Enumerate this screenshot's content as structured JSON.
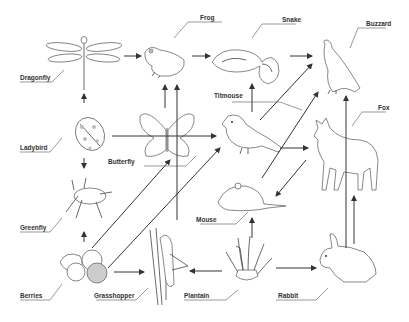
{
  "diagram": {
    "type": "food-web",
    "organisms": [
      {
        "id": "dragonfly",
        "label": "Dragonfly"
      },
      {
        "id": "frog",
        "label": "Frog"
      },
      {
        "id": "snake",
        "label": "Snake"
      },
      {
        "id": "buzzard",
        "label": "Buzzard"
      },
      {
        "id": "ladybird",
        "label": "Ladybird"
      },
      {
        "id": "butterfly",
        "label": "Butterfly"
      },
      {
        "id": "titmouse",
        "label": "Titmouse"
      },
      {
        "id": "fox",
        "label": "Fox"
      },
      {
        "id": "mouse",
        "label": "Mouse"
      },
      {
        "id": "greenfly",
        "label": "Greenfly"
      },
      {
        "id": "berries",
        "label": "Berries"
      },
      {
        "id": "grasshopper",
        "label": "Grasshopper"
      },
      {
        "id": "plantain",
        "label": "Plantain"
      },
      {
        "id": "rabbit",
        "label": "Rabbit"
      }
    ],
    "edges": [
      {
        "from": "dragonfly",
        "to": "frog"
      },
      {
        "from": "frog",
        "to": "snake"
      },
      {
        "from": "snake",
        "to": "buzzard"
      },
      {
        "from": "ladybird",
        "to": "dragonfly"
      },
      {
        "from": "ladybird",
        "to": "titmouse"
      },
      {
        "from": "greenfly",
        "to": "ladybird"
      },
      {
        "from": "berries",
        "to": "greenfly"
      },
      {
        "from": "butterfly",
        "to": "frog"
      },
      {
        "from": "grasshopper",
        "to": "frog"
      },
      {
        "from": "titmouse",
        "to": "snake"
      },
      {
        "from": "titmouse",
        "to": "fox"
      },
      {
        "from": "mouse",
        "to": "buzzard"
      },
      {
        "from": "fox",
        "to": "mouse"
      },
      {
        "from": "berries",
        "to": "butterfly"
      },
      {
        "from": "berries",
        "to": "titmouse"
      },
      {
        "from": "berries",
        "to": "grasshopper"
      },
      {
        "from": "plantain",
        "to": "grasshopper"
      },
      {
        "from": "plantain",
        "to": "mouse"
      },
      {
        "from": "plantain",
        "to": "rabbit"
      },
      {
        "from": "rabbit",
        "to": "fox"
      },
      {
        "from": "rabbit",
        "to": "buzzard"
      },
      {
        "from": "grasshopper",
        "to": "titmouse"
      }
    ]
  }
}
